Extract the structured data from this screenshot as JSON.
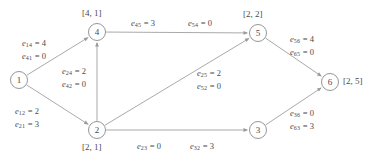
{
  "figure": {
    "kind": "directed-flow-network-graph"
  },
  "nodes": [
    {
      "id": "1",
      "label": "1",
      "cx": 19,
      "cy": 80,
      "r": 8.5,
      "bracket": null,
      "bracket_x": null,
      "bracket_y": null
    },
    {
      "id": "2",
      "label": "2",
      "cx": 97,
      "cy": 130,
      "r": 8.5,
      "bracket": "[2, 1]",
      "bracket_x": 82,
      "bracket_y": 142
    },
    {
      "id": "3",
      "label": "3",
      "cx": 258,
      "cy": 130,
      "r": 8.5,
      "bracket": null,
      "bracket_x": null,
      "bracket_y": null
    },
    {
      "id": "4",
      "label": "4",
      "cx": 97,
      "cy": 32,
      "r": 8.5,
      "bracket": "[4, 1]",
      "bracket_x": 82,
      "bracket_y": 8
    },
    {
      "id": "5",
      "label": "5",
      "cx": 258,
      "cy": 33,
      "r": 8.5,
      "bracket": "[2, 2]",
      "bracket_x": 243,
      "bracket_y": 9
    },
    {
      "id": "6",
      "label": "6",
      "cx": 330,
      "cy": 82,
      "r": 8.5,
      "bracket": "[2, 5]",
      "bracket_x": 343,
      "bracket_y": 76
    }
  ],
  "edges": [
    {
      "from": "1",
      "to": "4",
      "arrow_at": "4"
    },
    {
      "from": "1",
      "to": "2",
      "arrow_at": "2"
    },
    {
      "from": "2",
      "to": "4",
      "arrow_at": "4"
    },
    {
      "from": "4",
      "to": "5",
      "arrow_at": "5"
    },
    {
      "from": "2",
      "to": "5",
      "arrow_at": "5"
    },
    {
      "from": "2",
      "to": "3",
      "arrow_at": "3"
    },
    {
      "from": "5",
      "to": "6",
      "arrow_at": "6"
    },
    {
      "from": "3",
      "to": "6",
      "arrow_at": "6"
    }
  ],
  "edge_labels": [
    {
      "name": "edge-label-14-41",
      "x": 22,
      "y": 38,
      "lines": [
        {
          "sym": "e",
          "sub": "14",
          "val": "4"
        },
        {
          "sym": "e",
          "sub": "41",
          "val": "0"
        }
      ]
    },
    {
      "name": "edge-label-24-42",
      "x": 62,
      "y": 66,
      "lines": [
        {
          "sym": "e",
          "sub": "24",
          "val": "2"
        },
        {
          "sym": "e",
          "sub": "42",
          "val": "0"
        }
      ]
    },
    {
      "name": "edge-label-12-21",
      "x": 15,
      "y": 106,
      "lines": [
        {
          "sym": "e",
          "sub": "12",
          "val": "2"
        },
        {
          "sym": "e",
          "sub": "21",
          "val": "3"
        }
      ]
    },
    {
      "name": "edge-label-45",
      "x": 131,
      "y": 18,
      "lines": [
        {
          "sym": "e",
          "sub": "45",
          "val": "3"
        }
      ]
    },
    {
      "name": "edge-label-54",
      "x": 188,
      "y": 18,
      "lines": [
        {
          "sym": "e",
          "sub": "54",
          "val": "0"
        }
      ]
    },
    {
      "name": "edge-label-25-52",
      "x": 197,
      "y": 68,
      "lines": [
        {
          "sym": "e",
          "sub": "25",
          "val": "2"
        },
        {
          "sym": "e",
          "sub": "52",
          "val": "0"
        }
      ]
    },
    {
      "name": "edge-label-56-65",
      "x": 290,
      "y": 34,
      "lines": [
        {
          "sym": "e",
          "sub": "56",
          "val": "4"
        },
        {
          "sym": "e",
          "sub": "65",
          "val": "0"
        }
      ]
    },
    {
      "name": "edge-label-36-63",
      "x": 290,
      "y": 108,
      "lines": [
        {
          "sym": "e",
          "sub": "36",
          "val": "0"
        },
        {
          "sym": "e",
          "sub": "63",
          "val": "3"
        }
      ]
    },
    {
      "name": "edge-label-23",
      "x": 137,
      "y": 141,
      "lines": [
        {
          "sym": "e",
          "sub": "23",
          "val": "0"
        }
      ]
    },
    {
      "name": "edge-label-32",
      "x": 190,
      "y": 141,
      "lines": [
        {
          "sym": "e",
          "sub": "32",
          "val": "3"
        }
      ]
    }
  ],
  "colors": {
    "stroke": "#9a9a9a",
    "node_stroke": "#8a8a8a",
    "text": "#4a4a4a",
    "background": "#ffffff"
  }
}
